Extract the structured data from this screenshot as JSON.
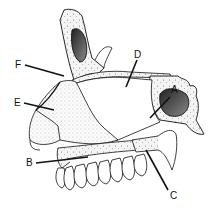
{
  "figure": {
    "type": "anatomical-diagram",
    "labels": [
      {
        "id": "A",
        "text": "A",
        "x": 173,
        "y": 91
      },
      {
        "id": "B",
        "text": "B",
        "x": 28,
        "y": 166
      },
      {
        "id": "C",
        "text": "C",
        "x": 172,
        "y": 199
      },
      {
        "id": "D",
        "text": "D",
        "x": 136,
        "y": 58
      },
      {
        "id": "E",
        "text": "E",
        "x": 15,
        "y": 108
      },
      {
        "id": "F",
        "text": "F",
        "x": 17,
        "y": 69
      }
    ],
    "colors": {
      "line": "#111111",
      "background": "#ffffff",
      "bone_fill": "#f2f2f2",
      "sinus_fill": "#555555"
    }
  }
}
